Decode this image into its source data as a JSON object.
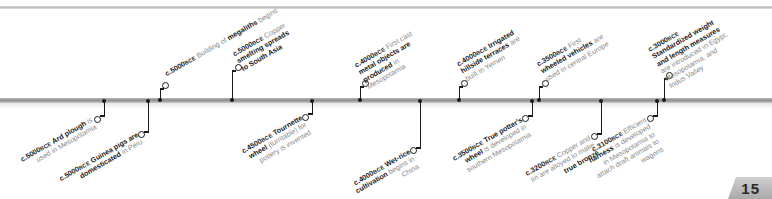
{
  "page": {
    "number": "15"
  },
  "timeline": {
    "era_label": "BCE",
    "events_above": [
      {
        "date": "c.5000",
        "era": "BCE",
        "bold": "",
        "text_before": "Building of ",
        "highlight": "megaliths",
        "text_after": " begins",
        "x": 160
      },
      {
        "date": "c.5000",
        "era": "BCE",
        "text_before": "Copper ",
        "highlight": "smelting spreads to South Asia",
        "text_after": "",
        "x": 232
      },
      {
        "date": "c.4000",
        "era": "BCE",
        "text_before": "First cast ",
        "highlight": "metal objects are produced",
        "text_after": " in Mesopotamia",
        "x": 360
      },
      {
        "date": "c.4000",
        "era": "BCE",
        "text_before": "",
        "highlight": "Irrigated hillside terraces",
        "text_after": " are built in Yemen",
        "x": 459
      },
      {
        "date": "c.3500",
        "era": "BCE",
        "text_before": "First ",
        "highlight": "wheeled vehicles",
        "text_after": " are used in central Europe",
        "x": 539
      },
      {
        "date": "c.3000",
        "era": "BCE",
        "text_before": "",
        "highlight": "Standardized weight and length measures",
        "text_after": " are introduced in Egypt, Mesopotamia, and Indus Valley",
        "x": 664
      }
    ],
    "events_below": [
      {
        "date": "c.5000",
        "era": "BCE",
        "text_before": "",
        "highlight": "Ard plough",
        "text_after": " is used in Mesopotamia",
        "x": 104
      },
      {
        "date": "c.5000",
        "era": "BCE",
        "text_before": "",
        "highlight": "Guinea pigs are domesticated",
        "text_after": " in Peru",
        "x": 148
      },
      {
        "date": "c.4500",
        "era": "BCE",
        "text_before": "",
        "highlight": "Tournette wheel",
        "text_after": " (turntable) for pottery is invented",
        "x": 312
      },
      {
        "date": "c.4000",
        "era": "BCE",
        "text_before": "",
        "highlight": "Wet-rice cultivation",
        "text_after": " begins in China",
        "x": 420
      },
      {
        "date": "c.3500",
        "era": "BCE",
        "text_before": "",
        "highlight": "True potter's wheel",
        "text_after": " is developed in southern Mesopotamia",
        "x": 532
      },
      {
        "date": "c.3200",
        "era": "BCE",
        "text_before": "Copper and tin are alloyed to make ",
        "highlight": "true bronze",
        "text_after": "",
        "x": 601
      },
      {
        "date": "c.3100",
        "era": "BCE",
        "text_before": "Efficient ",
        "highlight": "harness",
        "text_after": " is developed in Mesopotamia to attach draft animals to wagons",
        "x": 657
      }
    ]
  }
}
